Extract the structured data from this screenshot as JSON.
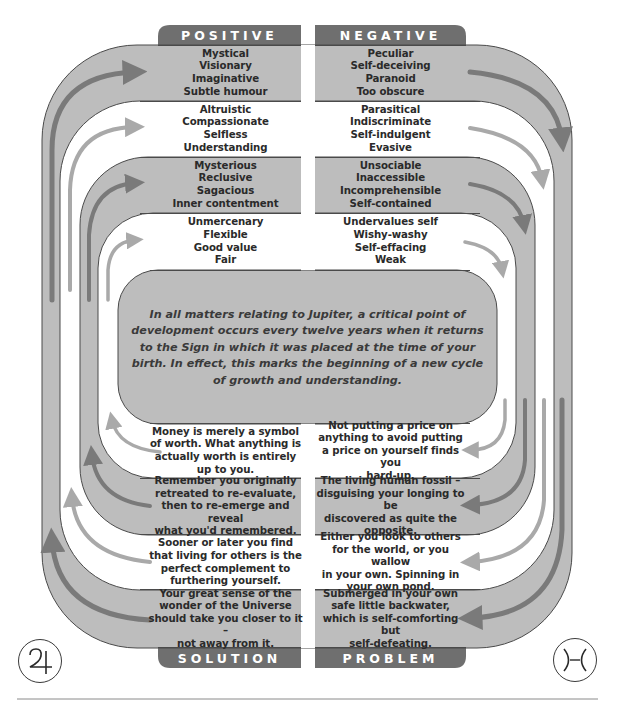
{
  "colors": {
    "band_gray": "#bdbdbd",
    "band_white": "#ffffff",
    "tab": "#6f6f6f",
    "outline": "#4a4a4a",
    "arrow_dark": "#7a7a7a",
    "arrow_light": "#a8a8a8"
  },
  "tabs": {
    "top_left": "POSITIVE",
    "top_right": "NEGATIVE",
    "bottom_left": "SOLUTION",
    "bottom_right": "PROBLEM"
  },
  "positive": [
    "Mystical\nVisionary\nImaginative\nSubtle humour",
    "Altruistic\nCompassionate\nSelfless\nUnderstanding",
    "Mysterious\nReclusive\nSagacious\nInner contentment",
    "Unmercenary\nFlexible\nGood value\nFair"
  ],
  "negative": [
    "Peculiar\nSelf-deceiving\nParanoid\nToo obscure",
    "Parasitical\nIndiscriminate\nSelf-indulgent\nEvasive",
    "Unsociable\nInaccessible\nIncomprehensible\nSelf-contained",
    "Undervalues self\nWishy-washy\nSelf-effacing\nWeak"
  ],
  "center_text": "In all matters relating to Jupiter, a critical point of development occurs every twelve years when it returns to the Sign in which it was placed at the time of your birth. In effect, this marks the beginning of a new cycle of growth and understanding.",
  "solution": [
    "Money is merely a symbol\nof worth. What anything is\nactually worth is entirely\nup to you.",
    "Remember you originally\nretreated to re-evaluate,\nthen to re-emerge and reveal\nwhat you'd remembered.",
    "Sooner or later you find\nthat living for others is the\nperfect complement to\nfurthering yourself.",
    "Your great sense of the\nwonder of the Universe\nshould take you closer to it –\nnot away from it."
  ],
  "problem": [
    "Not putting a price on\nanything to avoid putting\na price on yourself finds you\nhard-up.",
    "The living human fossil –\ndisguising your longing to be\ndiscovered as quite the\nopposite.",
    "Either you look to others\nfor the world, or you wallow\nin your own. Spinning in\nyour own pond.",
    "Submerged in your own\nsafe little backwater,\nwhich is self-comforting but\nself-defeating."
  ],
  "symbols": {
    "left": "jupiter-symbol",
    "right": "pisces-symbol"
  }
}
